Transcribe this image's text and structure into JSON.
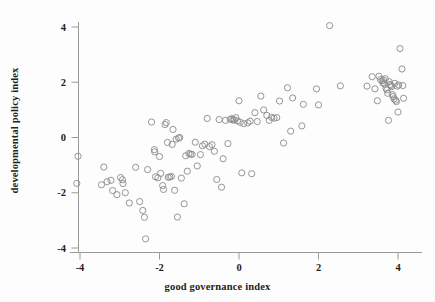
{
  "chart_data": {
    "type": "scatter",
    "title": "",
    "xlabel": "good governance index",
    "ylabel": "developmental policy index",
    "xlim": [
      -4.6,
      4.6
    ],
    "ylim": [
      -4.35,
      4.45
    ],
    "xticks": [
      -4,
      -2,
      0,
      2,
      4
    ],
    "xticklabels": [
      "-4",
      "-2",
      "0",
      "2",
      "4"
    ],
    "yticks": [
      -4,
      -2,
      0,
      2,
      4
    ],
    "yticklabels": [
      "-4",
      "-2",
      "0",
      "2",
      "4"
    ],
    "grid": false,
    "legend": null,
    "marker": "open-circle",
    "marker_color": "#8a8a8a",
    "marker_size": 3.1,
    "n_points": 128,
    "points": [
      [
        -4.08,
        -1.66
      ],
      [
        -4.05,
        -0.68
      ],
      [
        -3.46,
        -1.71
      ],
      [
        -3.4,
        -1.07
      ],
      [
        -3.22,
        -1.55
      ],
      [
        -3.18,
        -1.92
      ],
      [
        -3.07,
        -2.07
      ],
      [
        -2.98,
        -1.45
      ],
      [
        -2.93,
        -1.53
      ],
      [
        -2.92,
        -1.67
      ],
      [
        -2.76,
        -2.37
      ],
      [
        -2.6,
        -1.08
      ],
      [
        -2.5,
        -2.32
      ],
      [
        -2.42,
        -2.64
      ],
      [
        -2.38,
        -2.89
      ],
      [
        -2.35,
        -3.67
      ],
      [
        -2.3,
        -1.16
      ],
      [
        -2.2,
        0.56
      ],
      [
        -2.13,
        -0.44
      ],
      [
        -2.12,
        -0.52
      ],
      [
        -2.1,
        -1.42
      ],
      [
        -2.04,
        -1.46
      ],
      [
        -2.0,
        -0.69
      ],
      [
        -1.97,
        -1.3
      ],
      [
        -1.92,
        -1.74
      ],
      [
        -1.9,
        -1.88
      ],
      [
        -1.86,
        0.47
      ],
      [
        -1.83,
        0.54
      ],
      [
        -1.8,
        -0.18
      ],
      [
        -1.78,
        -1.44
      ],
      [
        -1.74,
        -1.43
      ],
      [
        -1.7,
        -1.41
      ],
      [
        -1.68,
        -0.25
      ],
      [
        -1.66,
        0.29
      ],
      [
        -1.62,
        -1.91
      ],
      [
        -1.58,
        -0.06
      ],
      [
        -1.55,
        -2.88
      ],
      [
        -1.52,
        -0.02
      ],
      [
        -1.49,
        0.0
      ],
      [
        -1.45,
        -1.47
      ],
      [
        -1.38,
        -2.4
      ],
      [
        -1.34,
        -0.66
      ],
      [
        -1.3,
        -1.22
      ],
      [
        -1.26,
        -0.58
      ],
      [
        -1.22,
        -0.6
      ],
      [
        -1.18,
        -0.61
      ],
      [
        -1.1,
        -0.17
      ],
      [
        -1.05,
        -1.03
      ],
      [
        -0.97,
        -0.62
      ],
      [
        -0.92,
        -0.3
      ],
      [
        -0.86,
        -0.24
      ],
      [
        -0.8,
        0.69
      ],
      [
        -0.74,
        -0.33
      ],
      [
        -0.68,
        -0.26
      ],
      [
        -0.62,
        -0.5
      ],
      [
        -0.56,
        -1.52
      ],
      [
        -0.5,
        0.65
      ],
      [
        -0.44,
        -1.8
      ],
      [
        -0.4,
        -0.77
      ],
      [
        -0.34,
        0.62
      ],
      [
        -0.28,
        -0.22
      ],
      [
        -0.22,
        0.66
      ],
      [
        -0.18,
        0.68
      ],
      [
        -0.15,
        0.63
      ],
      [
        -0.12,
        0.64
      ],
      [
        -0.08,
        0.72
      ],
      [
        -0.04,
        0.6
      ],
      [
        0.0,
        1.33
      ],
      [
        0.03,
        0.55
      ],
      [
        0.07,
        -1.28
      ],
      [
        0.12,
        0.5
      ],
      [
        0.22,
        0.53
      ],
      [
        0.28,
        0.59
      ],
      [
        0.32,
        -1.31
      ],
      [
        0.4,
        0.9
      ],
      [
        0.46,
        0.58
      ],
      [
        0.55,
        1.5
      ],
      [
        0.62,
        1.0
      ],
      [
        0.7,
        0.8
      ],
      [
        0.76,
        0.62
      ],
      [
        0.82,
        0.73
      ],
      [
        0.88,
        0.7
      ],
      [
        0.95,
        0.72
      ],
      [
        1.02,
        1.32
      ],
      [
        1.12,
        -0.2
      ],
      [
        1.22,
        1.8
      ],
      [
        1.3,
        0.23
      ],
      [
        1.35,
        1.43
      ],
      [
        1.58,
        0.42
      ],
      [
        1.62,
        1.2
      ],
      [
        1.95,
        1.76
      ],
      [
        2.0,
        1.18
      ],
      [
        2.28,
        4.05
      ],
      [
        2.55,
        1.87
      ],
      [
        3.22,
        1.86
      ],
      [
        3.35,
        2.2
      ],
      [
        3.42,
        1.76
      ],
      [
        3.48,
        1.33
      ],
      [
        3.52,
        2.22
      ],
      [
        3.56,
        2.1
      ],
      [
        3.6,
        2.05
      ],
      [
        3.62,
        1.98
      ],
      [
        3.64,
        2.08
      ],
      [
        3.66,
        1.93
      ],
      [
        3.68,
        2.13
      ],
      [
        3.7,
        1.78
      ],
      [
        3.72,
        1.72
      ],
      [
        3.74,
        1.6
      ],
      [
        3.76,
        0.62
      ],
      [
        3.78,
        2.02
      ],
      [
        3.8,
        1.92
      ],
      [
        3.82,
        1.88
      ],
      [
        3.84,
        1.84
      ],
      [
        3.86,
        1.55
      ],
      [
        3.88,
        1.48
      ],
      [
        3.9,
        1.4
      ],
      [
        3.92,
        1.96
      ],
      [
        3.94,
        1.35
      ],
      [
        3.96,
        1.3
      ],
      [
        3.98,
        1.86
      ],
      [
        4.0,
        0.92
      ],
      [
        4.02,
        1.9
      ],
      [
        4.05,
        3.22
      ],
      [
        4.1,
        2.48
      ],
      [
        4.12,
        1.88
      ],
      [
        4.14,
        1.42
      ],
      [
        -3.32,
        -1.6
      ],
      [
        -2.86,
        -2.0
      ]
    ]
  },
  "figure": {
    "background_color": "#fdfdfd",
    "axis_color": "#9a9a9a",
    "text_color": "#231f20"
  }
}
